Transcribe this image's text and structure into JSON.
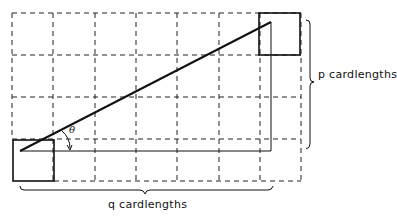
{
  "diagram": {
    "labels": {
      "p": "p cardlengths",
      "q": "q cardlengths",
      "angle": "θ"
    },
    "grid": {
      "columns": 7,
      "rows": 4,
      "style": "dashed"
    },
    "colors": {
      "line": "#111111",
      "background": "#ffffff"
    }
  }
}
